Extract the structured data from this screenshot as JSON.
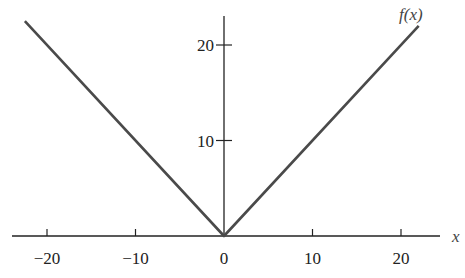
{
  "chart_data": {
    "type": "line",
    "title": "",
    "xlabel": "x",
    "ylabel": "",
    "series": [
      {
        "name": "f(x)",
        "x": [
          -22.5,
          0,
          22
        ],
        "y": [
          22.5,
          0,
          22
        ]
      }
    ],
    "function_label": "f(x)",
    "x_ticks": [
      -20,
      -10,
      0,
      10,
      20
    ],
    "x_tick_labels": [
      "−20",
      "−10",
      "0",
      "10",
      "20"
    ],
    "y_ticks": [
      10,
      20
    ],
    "y_tick_labels": [
      "10",
      "20"
    ],
    "xlim": [
      -25,
      25
    ],
    "ylim": [
      0,
      23
    ],
    "grid": false,
    "legend": "none"
  }
}
